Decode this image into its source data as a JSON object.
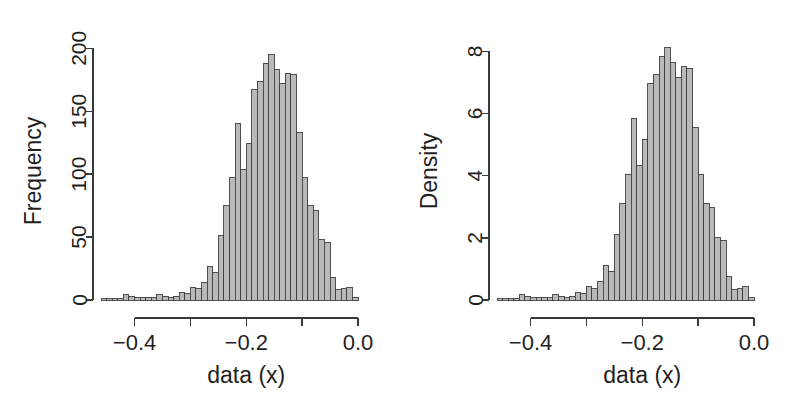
{
  "figure": {
    "background": "#ffffff",
    "bar_fill": "#b9b9b9",
    "bar_stroke": "#404040",
    "axis_color": "#3a3a3a",
    "text_color": "#1f1f1f",
    "panel_count": 2
  },
  "chart_data": [
    {
      "type": "bar",
      "panel": "left",
      "title": "",
      "xlabel": "data (x)",
      "ylabel": "Frequency",
      "xlim": [
        -0.46,
        0.0
      ],
      "ylim": [
        0,
        205
      ],
      "grid": false,
      "legend": null,
      "xticks": [
        -0.4,
        -0.3,
        -0.2,
        -0.1,
        0.0
      ],
      "xtick_labels": [
        "-0.4",
        "",
        "-0.2",
        "",
        "0.0"
      ],
      "yticks": [
        0,
        50,
        100,
        150,
        200
      ],
      "ytick_labels": [
        "0",
        "50",
        "100",
        "150",
        "200"
      ],
      "bin_width": 0.01,
      "bin_starts": [
        -0.46,
        -0.45,
        -0.44,
        -0.43,
        -0.42,
        -0.41,
        -0.4,
        -0.39,
        -0.38,
        -0.37,
        -0.36,
        -0.35,
        -0.34,
        -0.33,
        -0.32,
        -0.31,
        -0.3,
        -0.29,
        -0.28,
        -0.27,
        -0.26,
        -0.25,
        -0.24,
        -0.23,
        -0.22,
        -0.21,
        -0.2,
        -0.19,
        -0.18,
        -0.17,
        -0.16,
        -0.15,
        -0.14,
        -0.13,
        -0.12,
        -0.11,
        -0.1,
        -0.09,
        -0.08,
        -0.07,
        -0.06,
        -0.05,
        -0.04,
        -0.03,
        -0.02,
        -0.01
      ],
      "categories": [
        "-0.46",
        "-0.45",
        "-0.44",
        "-0.43",
        "-0.42",
        "-0.41",
        "-0.40",
        "-0.39",
        "-0.38",
        "-0.37",
        "-0.36",
        "-0.35",
        "-0.34",
        "-0.33",
        "-0.32",
        "-0.31",
        "-0.30",
        "-0.29",
        "-0.28",
        "-0.27",
        "-0.26",
        "-0.25",
        "-0.24",
        "-0.23",
        "-0.22",
        "-0.21",
        "-0.20",
        "-0.19",
        "-0.18",
        "-0.17",
        "-0.16",
        "-0.15",
        "-0.14",
        "-0.13",
        "-0.12",
        "-0.11",
        "-0.10",
        "-0.09",
        "-0.08",
        "-0.07",
        "-0.06",
        "-0.05",
        "-0.04",
        "-0.03",
        "-0.02",
        "-0.01"
      ],
      "values": [
        1,
        1,
        1,
        1,
        4,
        3,
        2,
        2,
        2,
        2,
        4,
        3,
        2,
        3,
        6,
        5,
        10,
        9,
        14,
        27,
        22,
        51,
        75,
        97,
        140,
        104,
        124,
        167,
        174,
        188,
        195,
        183,
        172,
        180,
        179,
        133,
        97,
        75,
        71,
        48,
        46,
        18,
        8,
        9,
        10,
        2
      ]
    },
    {
      "type": "bar",
      "panel": "right",
      "title": "",
      "xlabel": "data (x)",
      "ylabel": "Density",
      "xlim": [
        -0.46,
        0.0
      ],
      "ylim": [
        0,
        8.3
      ],
      "grid": false,
      "legend": null,
      "xticks": [
        -0.4,
        -0.3,
        -0.2,
        -0.1,
        0.0
      ],
      "xtick_labels": [
        "-0.4",
        "",
        "-0.2",
        "",
        "0.0"
      ],
      "yticks": [
        0,
        2,
        4,
        6,
        8
      ],
      "ytick_labels": [
        "0",
        "2",
        "4",
        "6",
        "8"
      ],
      "bin_width": 0.01,
      "bin_starts": [
        -0.46,
        -0.45,
        -0.44,
        -0.43,
        -0.42,
        -0.41,
        -0.4,
        -0.39,
        -0.38,
        -0.37,
        -0.36,
        -0.35,
        -0.34,
        -0.33,
        -0.32,
        -0.31,
        -0.3,
        -0.29,
        -0.28,
        -0.27,
        -0.26,
        -0.25,
        -0.24,
        -0.23,
        -0.22,
        -0.21,
        -0.2,
        -0.19,
        -0.18,
        -0.17,
        -0.16,
        -0.15,
        -0.14,
        -0.13,
        -0.12,
        -0.11,
        -0.1,
        -0.09,
        -0.08,
        -0.07,
        -0.06,
        -0.05,
        -0.04,
        -0.03,
        -0.02,
        -0.01
      ],
      "categories": [
        "-0.46",
        "-0.45",
        "-0.44",
        "-0.43",
        "-0.42",
        "-0.41",
        "-0.40",
        "-0.39",
        "-0.38",
        "-0.37",
        "-0.36",
        "-0.35",
        "-0.34",
        "-0.33",
        "-0.32",
        "-0.31",
        "-0.30",
        "-0.29",
        "-0.28",
        "-0.27",
        "-0.26",
        "-0.25",
        "-0.24",
        "-0.23",
        "-0.22",
        "-0.21",
        "-0.20",
        "-0.19",
        "-0.18",
        "-0.17",
        "-0.16",
        "-0.15",
        "-0.14",
        "-0.13",
        "-0.12",
        "-0.11",
        "-0.10",
        "-0.09",
        "-0.08",
        "-0.07",
        "-0.06",
        "-0.05",
        "-0.04",
        "-0.03",
        "-0.02",
        "-0.01"
      ],
      "values": [
        0.04,
        0.04,
        0.04,
        0.04,
        0.17,
        0.12,
        0.08,
        0.08,
        0.08,
        0.08,
        0.17,
        0.12,
        0.08,
        0.12,
        0.25,
        0.21,
        0.42,
        0.37,
        0.58,
        1.12,
        0.92,
        2.12,
        3.12,
        4.04,
        5.83,
        4.33,
        5.17,
        6.96,
        7.25,
        7.83,
        8.12,
        7.63,
        7.17,
        7.5,
        7.46,
        5.54,
        4.04,
        3.12,
        2.96,
        2.0,
        1.92,
        0.75,
        0.33,
        0.37,
        0.42,
        0.08
      ]
    }
  ]
}
